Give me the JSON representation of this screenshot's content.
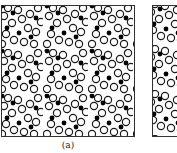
{
  "figure": {
    "panels": [
      {
        "id": "a",
        "label": "(a)",
        "content": "lattice of open circles with black filled nodes"
      },
      {
        "id": "b",
        "label": "",
        "content": "partially visible lattice (cropped)"
      }
    ],
    "colors": {
      "line": "#1a1a1a",
      "node": "#000000",
      "background": "#ffffff"
    }
  }
}
